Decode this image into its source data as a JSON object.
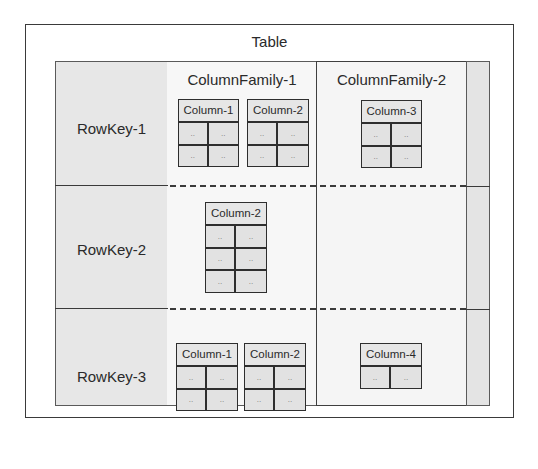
{
  "table": {
    "title": "Table"
  },
  "column_families": [
    {
      "label": "ColumnFamily-1"
    },
    {
      "label": "ColumnFamily-2"
    }
  ],
  "rows": [
    {
      "rowkey": "RowKey-1",
      "columns": [
        {
          "family": "ColumnFamily-1",
          "label": "Column-1",
          "cells": [
            "..",
            "..",
            "..",
            ".."
          ]
        },
        {
          "family": "ColumnFamily-1",
          "label": "Column-2",
          "cells": [
            "..",
            "..",
            "..",
            ".."
          ]
        },
        {
          "family": "ColumnFamily-2",
          "label": "Column-3",
          "cells": [
            "..",
            "..",
            "..",
            ".."
          ]
        }
      ]
    },
    {
      "rowkey": "RowKey-2",
      "columns": [
        {
          "family": "ColumnFamily-1",
          "label": "Column-2",
          "cells": [
            "..",
            "..",
            "..",
            "..",
            "..",
            ".."
          ]
        }
      ]
    },
    {
      "rowkey": "RowKey-3",
      "columns": [
        {
          "family": "ColumnFamily-1",
          "label": "Column-1",
          "cells": [
            "..",
            "..",
            "..",
            ".."
          ]
        },
        {
          "family": "ColumnFamily-1",
          "label": "Column-2",
          "cells": [
            "..",
            "..",
            "..",
            ".."
          ]
        },
        {
          "family": "ColumnFamily-2",
          "label": "Column-4",
          "cells": [
            "..",
            ".."
          ]
        }
      ]
    }
  ],
  "colors": {
    "rowkey_fill": "#e7e7e7",
    "family_fill": "#f6f6f6",
    "cell_fill": "#e2e2e2",
    "stroke": "#2e2e2e"
  }
}
